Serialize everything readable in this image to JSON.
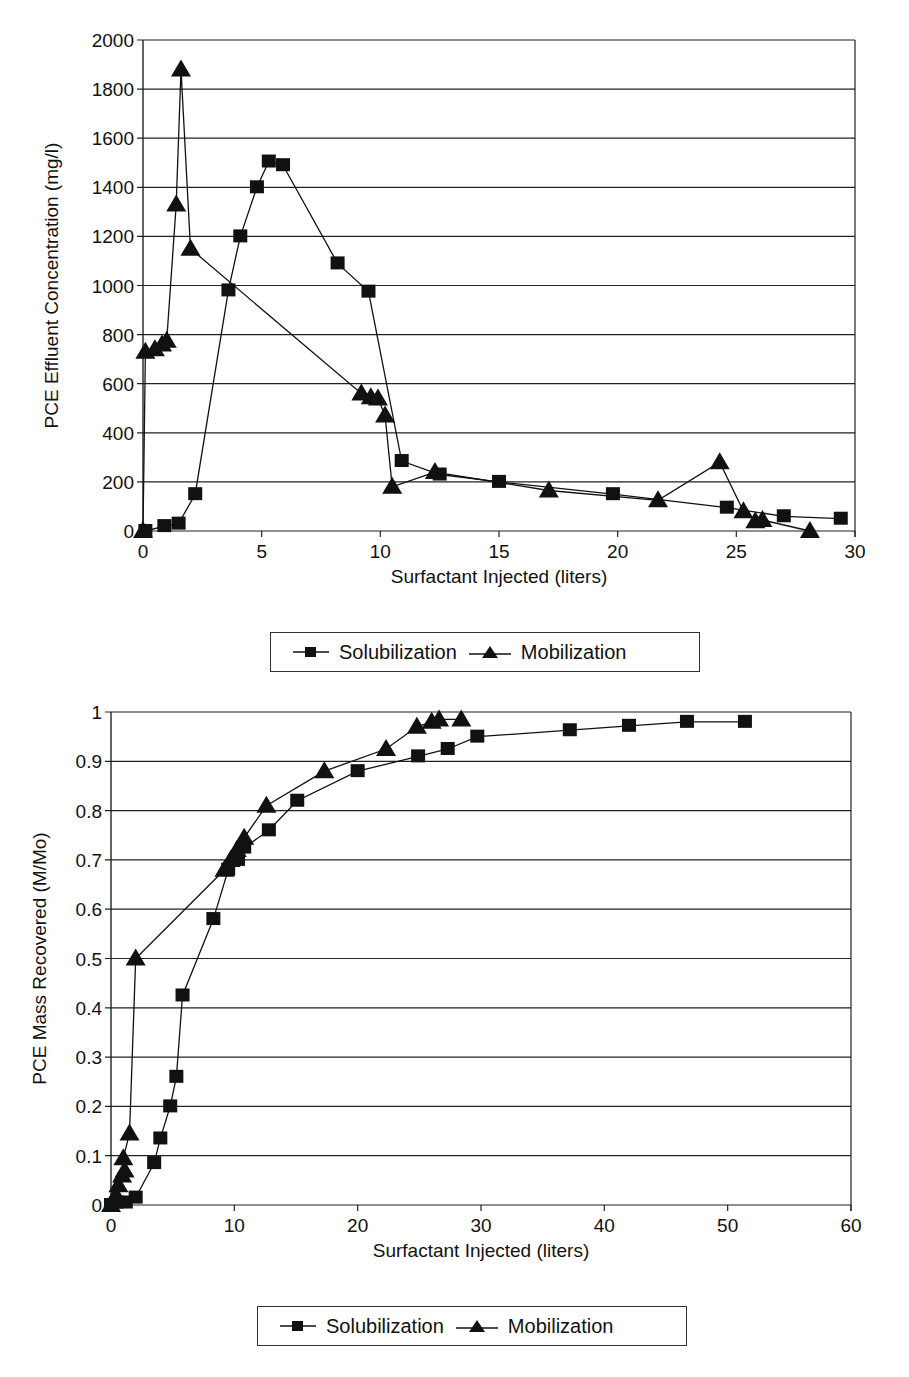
{
  "chart_data": [
    {
      "type": "line",
      "title": "",
      "xlabel": "Surfactant Injected (liters)",
      "ylabel": "PCE Effluent Concentration (mg/l)",
      "xlim": [
        0,
        30
      ],
      "ylim": [
        0,
        2000
      ],
      "xticks": [
        0,
        5,
        10,
        15,
        20,
        25,
        30
      ],
      "yticks": [
        0,
        200,
        400,
        600,
        800,
        1000,
        1200,
        1400,
        1600,
        1800,
        2000
      ],
      "grid": "horizontal",
      "legend_position": "bottom",
      "series": [
        {
          "name": "Solubilization",
          "marker": "square",
          "x": [
            0.1,
            0.9,
            1.5,
            2.2,
            3.6,
            4.1,
            4.8,
            5.3,
            5.9,
            8.2,
            9.5,
            10.9,
            12.5,
            15.0,
            19.8,
            24.6,
            27.0,
            29.4
          ],
          "y": [
            0,
            20,
            30,
            150,
            980,
            1200,
            1400,
            1505,
            1490,
            1090,
            975,
            285,
            230,
            200,
            150,
            95,
            60,
            50
          ]
        },
        {
          "name": "Mobilization",
          "marker": "triangle",
          "x": [
            0,
            0.1,
            0.5,
            0.8,
            1.0,
            1.4,
            1.6,
            2.0,
            9.2,
            9.6,
            9.9,
            10.2,
            10.5,
            12.3,
            17.1,
            21.7,
            24.3,
            25.3,
            25.8,
            26.1,
            28.1
          ],
          "y": [
            0,
            730,
            740,
            760,
            775,
            1330,
            1880,
            1150,
            560,
            545,
            540,
            470,
            180,
            240,
            165,
            125,
            280,
            80,
            40,
            45,
            0
          ]
        }
      ]
    },
    {
      "type": "line",
      "title": "",
      "xlabel": "Surfactant Injected (liters)",
      "ylabel": "PCE Mass Recovered (M/Mo)",
      "xlim": [
        0,
        60
      ],
      "ylim": [
        0,
        1
      ],
      "xticks": [
        0,
        10,
        20,
        30,
        40,
        50,
        60
      ],
      "yticks": [
        0,
        0.1,
        0.2,
        0.3,
        0.4,
        0.5,
        0.6,
        0.7,
        0.8,
        0.9,
        1
      ],
      "grid": "horizontal",
      "legend_position": "bottom",
      "series": [
        {
          "name": "Solubilization",
          "marker": "square",
          "x": [
            0,
            0.5,
            1.2,
            2.0,
            3.5,
            4.0,
            4.8,
            5.3,
            5.8,
            8.3,
            9.5,
            10.3,
            10.8,
            12.8,
            15.1,
            20.0,
            24.9,
            27.3,
            29.7,
            37.2,
            42.0,
            46.7,
            51.4
          ],
          "y": [
            0,
            0.005,
            0.005,
            0.015,
            0.085,
            0.135,
            0.2,
            0.26,
            0.425,
            0.58,
            0.68,
            0.7,
            0.725,
            0.76,
            0.82,
            0.88,
            0.91,
            0.925,
            0.95,
            0.963,
            0.972,
            0.98,
            0.98
          ]
        },
        {
          "name": "Mobilization",
          "marker": "triangle",
          "x": [
            0,
            0.2,
            0.4,
            0.6,
            0.9,
            1.1,
            1.0,
            1.5,
            2.0,
            9.2,
            9.7,
            10.2,
            10.5,
            10.8,
            12.6,
            17.3,
            22.3,
            24.8,
            26.0,
            26.6,
            28.4
          ],
          "y": [
            0,
            0.01,
            0.02,
            0.04,
            0.06,
            0.07,
            0.095,
            0.145,
            0.5,
            0.68,
            0.7,
            0.72,
            0.73,
            0.745,
            0.81,
            0.88,
            0.925,
            0.97,
            0.98,
            0.985,
            0.985
          ]
        }
      ]
    }
  ],
  "legends": [
    {
      "items": [
        "Solubilization",
        "Mobilization"
      ]
    },
    {
      "items": [
        "Solubilization",
        "Mobilization"
      ]
    }
  ]
}
